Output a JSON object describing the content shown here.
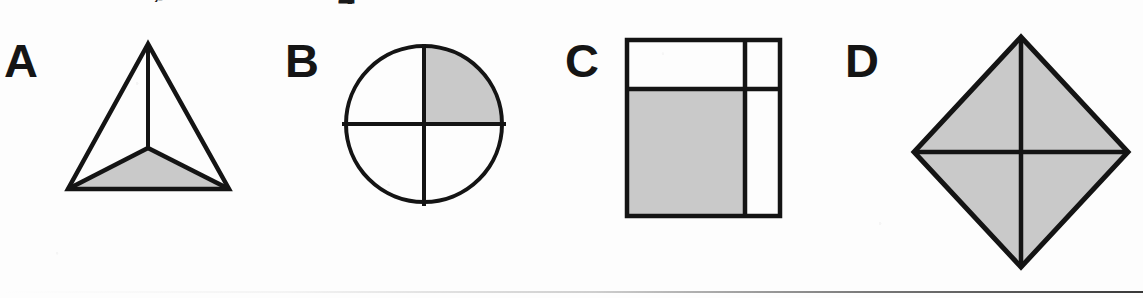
{
  "page": {
    "width": 1143,
    "height": 298,
    "background": "#fdfdfd",
    "ink_color": "#141414",
    "shade_color": "#c9c9c9"
  },
  "clipped_header": {
    "fragment_left": "g",
    "fragment_right": "4"
  },
  "figures": [
    {
      "id": "A",
      "label": "A",
      "shape": "triangle-with-interior-point",
      "description": "Equilateral triangle partitioned into three triangles by segments from an interior point to each vertex; the lower region is shaded.",
      "regions_total": 3,
      "regions_shaded": 1,
      "shaded_region": "bottom"
    },
    {
      "id": "B",
      "label": "B",
      "shape": "circle-quartered",
      "description": "Circle divided into four equal quadrants by a vertical and a horizontal diameter; the upper-right quadrant is shaded.",
      "regions_total": 4,
      "regions_shaded": 1,
      "shaded_region": "upper-right"
    },
    {
      "id": "C",
      "label": "C",
      "shape": "square-unequal-partition",
      "description": "Square divided by one horizontal and one vertical line into four unequal rectangles; the large lower-left rectangle is shaded.",
      "regions_total": 4,
      "regions_shaded": 1,
      "shaded_region": "lower-left"
    },
    {
      "id": "D",
      "label": "D",
      "shape": "diamond-quartered",
      "description": "Diamond (square rotated 45 degrees) divided into four equal triangles by its vertical and horizontal diagonals; the entire figure is shaded.",
      "regions_total": 4,
      "regions_shaded": 4,
      "shaded_region": "all"
    }
  ],
  "bottom_rule": {
    "present": true
  }
}
